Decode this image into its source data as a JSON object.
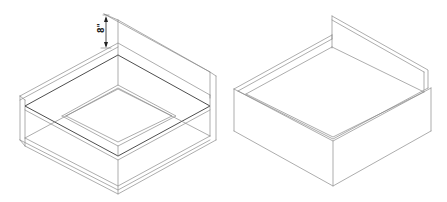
{
  "figure": {
    "left_view": {
      "name": "Wireframe tray assembly with dimension",
      "dimension_label": "8\""
    },
    "right_view": {
      "name": "Solid tray with back splash"
    },
    "colors": {
      "background": "#ffffff",
      "line": "#8a8a8a",
      "line_dark": "#3a3a3a",
      "dimension": "#222222"
    }
  }
}
